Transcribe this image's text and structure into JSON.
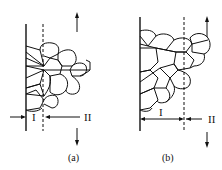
{
  "figures": [
    {
      "id": "a",
      "caption": "(a)",
      "region_I_label": "I",
      "region_II_label": "II"
    },
    {
      "id": "b",
      "caption": "(b)",
      "region_I_label": "I",
      "region_II_label": "II"
    }
  ],
  "colors": {
    "line": "#111111",
    "background": "#ffffff"
  }
}
